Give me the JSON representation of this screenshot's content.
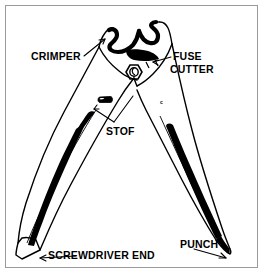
{
  "figure": {
    "type": "line-drawing",
    "background_color": "#ffffff",
    "line_color": "#000000",
    "frame_color": "#9a9a9a"
  },
  "labels": {
    "crimper": "CRIMPER",
    "fuse": "FUSE",
    "cutter": "CUTTER",
    "stof": "STOF",
    "screwdriver_end": "SCREWDRIVER END",
    "punch": "PUNCH",
    "mark_c": "c"
  },
  "callouts": [
    {
      "name": "crimper",
      "label": "CRIMPER",
      "target": "upper jaw crimping notch"
    },
    {
      "name": "fuse-cutter",
      "label": "FUSE CUTTER",
      "target": "jaw fuse cutting slot"
    },
    {
      "name": "stof",
      "label": "STOF",
      "target": "small stop tab on handle"
    },
    {
      "name": "screwdriver-end",
      "label": "SCREWDRIVER END",
      "target": "flat blade tip of left handle"
    },
    {
      "name": "punch",
      "label": "PUNCH",
      "target": "pointed tip of right handle"
    }
  ],
  "parts": [
    "crimper jaw",
    "fuse cutter",
    "pivot nut",
    "stop tab",
    "left handle",
    "right handle",
    "screwdriver end",
    "punch tip"
  ]
}
